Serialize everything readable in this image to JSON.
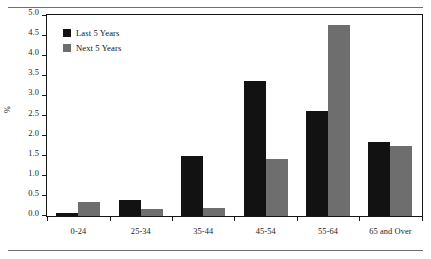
{
  "chart_data": {
    "type": "bar",
    "title": "",
    "subtitle": "",
    "xlabel": "",
    "ylabel": "%",
    "categories": [
      "0-24",
      "25-34",
      "35-44",
      "45-54",
      "55-64",
      "65 and Over"
    ],
    "series": [
      {
        "name": "Last 5 Years",
        "color": "#121212",
        "values": [
          0.06,
          0.38,
          1.5,
          3.35,
          2.6,
          1.85
        ]
      },
      {
        "name": "Next 5 Years",
        "color": "#6e6e6e",
        "values": [
          0.35,
          0.17,
          0.2,
          1.42,
          4.75,
          1.73
        ]
      }
    ],
    "ylim": [
      0.0,
      5.0
    ],
    "ytick_values": [
      0.0,
      0.5,
      1.0,
      1.5,
      2.0,
      2.5,
      3.0,
      3.5,
      4.0,
      4.5,
      5.0
    ],
    "ytick_labels": [
      "0.0",
      "0.5",
      "1.0",
      "1.5",
      "2.0",
      "2.5",
      "3.0",
      "3.5",
      "4.0",
      "4.5",
      "5.0"
    ],
    "grid": false,
    "legend_position": "upper-left",
    "legend_entries": [
      "Last 5 Years",
      "Next 5 Years"
    ]
  }
}
